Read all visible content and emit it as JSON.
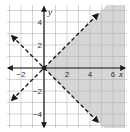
{
  "chart_data": {
    "type": "inequality-graph",
    "title": "",
    "xlabel": "x",
    "ylabel": "y",
    "xlim": [
      -3,
      7
    ],
    "ylim": [
      -5,
      5
    ],
    "grid": true,
    "x_tick_labels": [
      {
        "value": -2,
        "label": "−2"
      },
      {
        "value": 2,
        "label": "2"
      },
      {
        "value": 4,
        "label": "4"
      },
      {
        "value": 6,
        "label": "6"
      }
    ],
    "y_tick_labels": [
      {
        "value": 4,
        "label": "4"
      },
      {
        "value": 2,
        "label": "2"
      },
      {
        "value": -2,
        "label": "−2"
      },
      {
        "value": -4,
        "label": "−4"
      }
    ],
    "boundary_lines": [
      {
        "equation": "y = x",
        "style": "dashed",
        "from": [
          -2.8,
          -2.8
        ],
        "to": [
          4.7,
          4.7
        ],
        "arrows": "both"
      },
      {
        "equation": "y = -x",
        "style": "dashed",
        "from": [
          -2.8,
          2.8
        ],
        "to": [
          4.7,
          -4.7
        ],
        "arrows": "both"
      }
    ],
    "shaded_region": {
      "description": "y < x and y > -x",
      "vertices": [
        [
          0,
          0
        ],
        [
          7,
          7
        ],
        [
          7,
          -7
        ]
      ]
    },
    "highlighted_point": [
      0,
      0
    ],
    "colors": {
      "shade": "#d6d6d6",
      "grid": "#b5b5b5",
      "axis": "#1a1a1a",
      "line": "#1a1a1a"
    }
  }
}
